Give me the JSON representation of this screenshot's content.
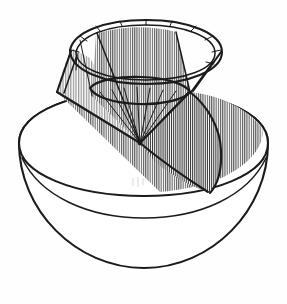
{
  "figure": {
    "caption": "",
    "background_color": "#ffffff",
    "ink_color": "#1b1b1b",
    "style": "hand-drawn pen-and-ink line diagram with vertical line hatching",
    "canvas": {
      "width": 287,
      "height": 304
    }
  },
  "solids": {
    "hemisphere": {
      "name": "hemisphere-bowl",
      "outline_color": "#1b1b1b",
      "fill_color": "#ffffff",
      "top_ellipse": {
        "cx": 143,
        "cy": 150,
        "rx": 125,
        "ry": 56,
        "rotation_deg": -7
      },
      "bowl_bottom": {
        "cx": 143,
        "cy": 150,
        "r": 125
      },
      "inner_rim_offset_px": 14,
      "cut_plane_label": "diagonal cut face"
    },
    "cone": {
      "name": "inverted-cone",
      "outline_color": "#1b1b1b",
      "apex": {
        "x": 140,
        "y": 143
      },
      "top_rim_ellipse": {
        "cx": 146,
        "cy": 62,
        "rx": 76,
        "ry": 34,
        "rotation_deg": -8
      },
      "base_ellipse": {
        "cx": 140,
        "cy": 93,
        "rx": 52,
        "ry": 18,
        "rotation_deg": -8
      },
      "rim_thickness_px": 6,
      "sector_count": 12,
      "hatched_sectors": [
        2,
        3,
        4,
        5,
        6
      ],
      "hatch_direction": "vertical",
      "hatch_spacing_px": 2
    }
  },
  "annotations": {
    "apex_marker": "cone apex at sphere center",
    "junction_left": {
      "x": 58,
      "y": 92
    },
    "junction_right": {
      "x": 190,
      "y": 92
    }
  },
  "labels": {
    "figure_label": "",
    "axis_label": "",
    "note": ""
  }
}
